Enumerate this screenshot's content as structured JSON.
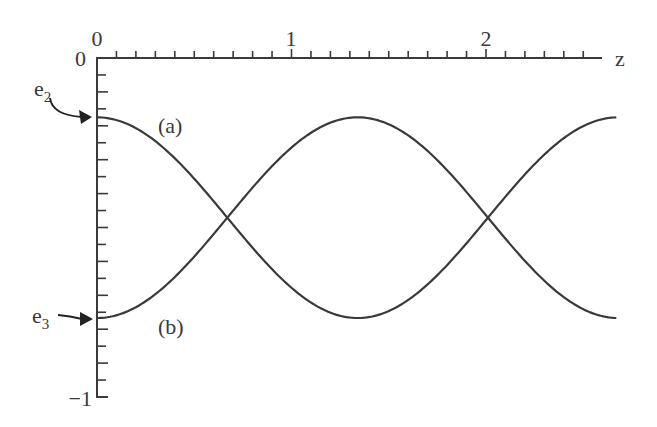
{
  "chart_data": {
    "type": "line",
    "title": "",
    "xlabel": "z",
    "ylabel": "",
    "xlim": [
      0,
      2.67
    ],
    "ylim": [
      -1,
      0
    ],
    "x_axis_position": "top",
    "x_ticks": {
      "major": [
        0,
        1,
        2
      ],
      "labels": [
        "0",
        "1",
        "2"
      ],
      "minor_step": 0.1
    },
    "y_ticks": {
      "major": [
        0,
        -1
      ],
      "labels": [
        "0",
        "−1"
      ],
      "minor_step": 0.05
    },
    "grid": false,
    "series": [
      {
        "name": "(a)",
        "start_label": "e2",
        "description": "starts at e2 (max), oscillates down to e3 and back",
        "x": [
          0.0,
          0.335,
          0.67,
          1.005,
          1.34,
          1.675,
          2.01,
          2.345,
          2.67
        ],
        "values": [
          -0.175,
          -0.262,
          -0.471,
          -0.68,
          -0.767,
          -0.68,
          -0.471,
          -0.262,
          -0.175
        ]
      },
      {
        "name": "(b)",
        "start_label": "e3",
        "description": "starts at e3 (min), oscillates up to e2 and back",
        "x": [
          0.0,
          0.335,
          0.67,
          1.005,
          1.34,
          1.675,
          2.01,
          2.345,
          2.67
        ],
        "values": [
          -0.767,
          -0.68,
          -0.471,
          -0.262,
          -0.175,
          -0.262,
          -0.471,
          -0.68,
          -0.767
        ]
      }
    ],
    "annotations": [
      {
        "text": "e2",
        "points_to": {
          "x": 0,
          "y": -0.175
        }
      },
      {
        "text": "e3",
        "points_to": {
          "x": 0,
          "y": -0.767
        }
      },
      {
        "text": "(a)",
        "near": {
          "x": 0.38,
          "y": -0.2
        }
      },
      {
        "text": "(b)",
        "near": {
          "x": 0.38,
          "y": -0.8
        }
      }
    ],
    "e2": -0.175,
    "e3": -0.767,
    "period": 2.68
  },
  "labels": {
    "x_axis": "z",
    "x_tick_0": "0",
    "x_tick_1": "1",
    "x_tick_2": "2",
    "y_tick_0": "0",
    "y_tick_neg1": "−1",
    "e2_main": "e",
    "e2_sub": "2",
    "e3_main": "e",
    "e3_sub": "3",
    "curve_a": "(a)",
    "curve_b": "(b)"
  },
  "colors": {
    "line": "#3a3a3a",
    "background": "#ffffff"
  }
}
